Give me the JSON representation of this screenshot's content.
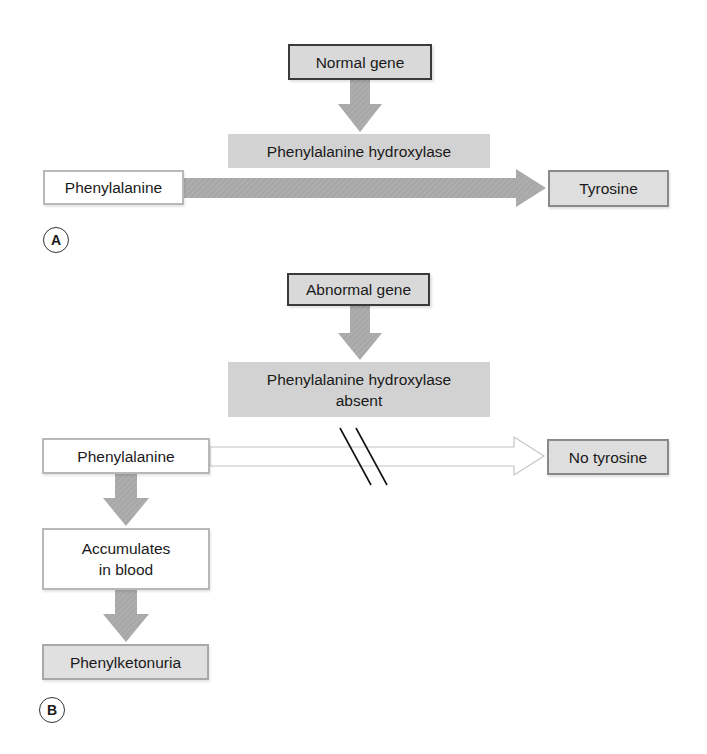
{
  "panel_a": {
    "label": "A",
    "gene": "Normal gene",
    "enzyme": "Phenylalanine hydroxylase",
    "substrate": "Phenylalanine",
    "product": "Tyrosine"
  },
  "panel_b": {
    "label": "B",
    "gene": "Abnormal gene",
    "enzyme_line1": "Phenylalanine hydroxylase",
    "enzyme_line2": "absent",
    "substrate": "Phenylalanine",
    "product": "No tyrosine",
    "accumulates_line1": "Accumulates",
    "accumulates_line2": "in blood",
    "disease": "Phenylketonuria"
  },
  "colors": {
    "arrow_fill": "#a6a6a6",
    "gene_box": "#d9d9d9",
    "enzyme_box": "#d2d2d2"
  }
}
